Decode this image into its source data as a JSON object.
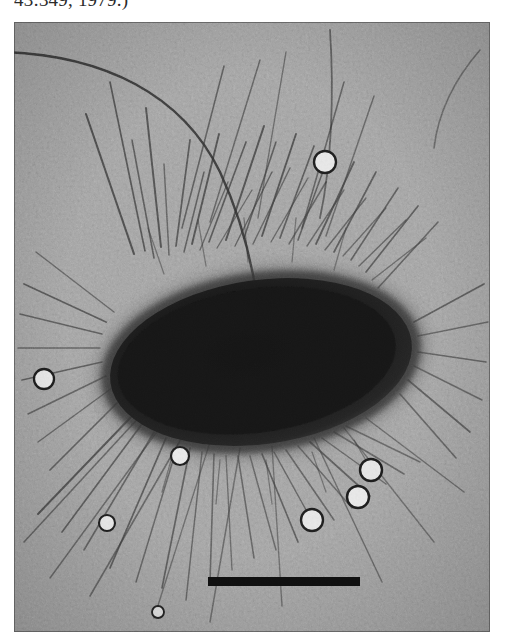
{
  "page": {
    "width": 505,
    "height": 642,
    "background_color": "#ffffff"
  },
  "caption": {
    "tail_text": "43:349, 1979.)",
    "note": "clipped bottom half of preceding figure-caption line",
    "color": "#2b2b2b"
  },
  "figure": {
    "kind": "transmission-electron-micrograph",
    "plate": {
      "x": 14,
      "y": 22,
      "width": 476,
      "height": 610
    },
    "background_gray": "#9e9e9e",
    "grain": "heavy photographic / halftone noise",
    "border_color": "#3c3c3c"
  },
  "cell_body": {
    "name": "bacterium",
    "shape": "ellipse",
    "cx": 247,
    "cy": 340,
    "rx": 158,
    "ry": 86,
    "rotation_deg": -8,
    "fill_color": "#1a1a1a",
    "halo_color": "#3a3a3a",
    "description": "electron-dense dark rod with fuzzy fimbriate margin"
  },
  "scale_bar": {
    "label": "",
    "x": 208,
    "y": 577,
    "width": 152,
    "height": 9,
    "color": "#121212"
  },
  "latex_beads": [
    {
      "id": "bead-1",
      "cx": 325,
      "cy": 162,
      "r": 11
    },
    {
      "id": "bead-2",
      "cx": 44,
      "cy": 379,
      "r": 10
    },
    {
      "id": "bead-3",
      "cx": 180,
      "cy": 456,
      "r": 9
    },
    {
      "id": "bead-4",
      "cx": 371,
      "cy": 470,
      "r": 11
    },
    {
      "id": "bead-5",
      "cx": 358,
      "cy": 497,
      "r": 11
    },
    {
      "id": "bead-6",
      "cx": 312,
      "cy": 520,
      "r": 11
    },
    {
      "id": "bead-7",
      "cx": 107,
      "cy": 523,
      "r": 8
    },
    {
      "id": "bead-8",
      "cx": 158,
      "cy": 612,
      "r": 6
    }
  ],
  "appendages": {
    "fimbriae_count_visible": 64,
    "fimbriae_color": "#3d3d3d",
    "flagella_count_visible": 2,
    "flagella_color": "#333333",
    "description": "numerous straight fimbriae radiate from the cell; one long sinuous flagellum sweeps across the upper-right field"
  }
}
